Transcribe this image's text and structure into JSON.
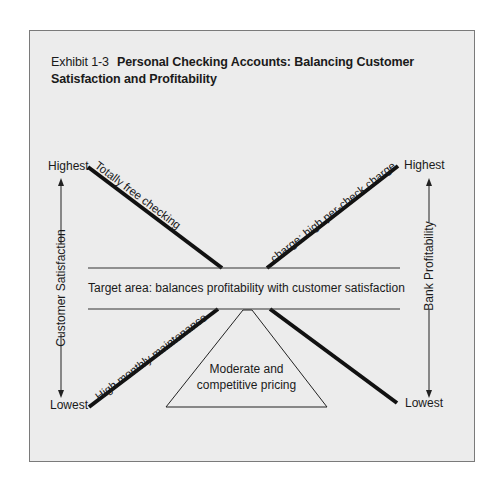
{
  "exhibit": {
    "label": "Exhibit 1-3",
    "title": "Personal Checking Accounts: Balancing Customer Satisfaction and Profitability"
  },
  "left_axis": {
    "label": "Customer Satisfaction",
    "top": "Highest",
    "bottom": "Lowest"
  },
  "right_axis": {
    "label": "Bank Profitability",
    "top": "Highest",
    "bottom": "Lowest"
  },
  "lines": {
    "top_left": "Totally free checking",
    "top_right": "charge; high per-check charge",
    "bottom_left": "High monthly maintenance"
  },
  "target_area": "Target area: balances profitability with customer satisfaction",
  "triangle": {
    "line1": "Moderate and",
    "line2": "competitive pricing"
  },
  "colors": {
    "background": "#ececec",
    "line": "#111111",
    "frame": "#7a7a7a"
  }
}
